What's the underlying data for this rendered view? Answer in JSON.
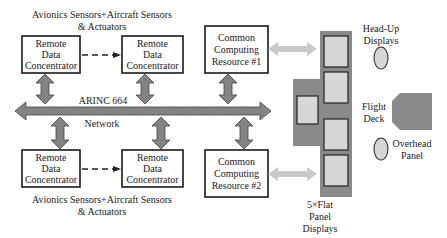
{
  "top_sensors_label": [
    "Avionics Sensors+Aircraft Sensors",
    "& Actuators"
  ],
  "bottom_sensors_label": [
    "Avionics Sensors+Aircraft Sensors",
    "& Actuators"
  ],
  "rdc_label": [
    "Remote",
    "Data",
    "Concentrator"
  ],
  "ccr1_label": [
    "Common",
    "Computing",
    "Resource #1"
  ],
  "ccr2_label": [
    "Common",
    "Computing",
    "Resource #2"
  ],
  "network": {
    "line1": "ARINC 664",
    "line2": "Network"
  },
  "head_up_label": [
    "Head-Up",
    "Displays"
  ],
  "flight_deck_label": [
    "Flight",
    "Deck"
  ],
  "overhead_label": [
    "Overhead",
    "Panel"
  ],
  "flat_panel_label": [
    "5×Flat",
    "Panel",
    "Displays"
  ],
  "colors": {
    "deck": "#8a8a8a",
    "screen": "#d6d6d6",
    "link_arrow": "#c9c9c9",
    "bus": "#7a7a7a"
  }
}
